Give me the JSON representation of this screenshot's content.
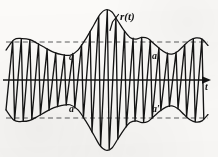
{
  "figure": {
    "kind": "waveform-plot",
    "caption_labels": {
      "signal": "r(t)",
      "envelope_upper_first": "a",
      "envelope_lower_first": "a",
      "envelope_upper_second": "a′",
      "envelope_lower_second": "a′",
      "axis_time": "t"
    },
    "colors": {
      "ink": "#141414",
      "dashed_guide": "#5d5d5d",
      "paper": "#fbfaf8"
    }
  },
  "chart_data": {
    "type": "line",
    "title": "r(t)",
    "xlabel": "t",
    "ylabel": "",
    "grid": false,
    "legend": null,
    "axis": {
      "baseline_y": 0,
      "time_axis_label": "t",
      "arrow_at_right": true,
      "x_range": [
        0,
        218
      ],
      "y_range": [
        -1.35,
        1.35
      ]
    },
    "guides": [
      {
        "name": "upper-dashed-level",
        "label": "a",
        "value": 0.66,
        "style": "dashed"
      },
      {
        "name": "lower-dashed-level",
        "label": "a",
        "value": -0.66,
        "style": "dashed"
      }
    ],
    "annotations": [
      {
        "text": "r(t)",
        "x": 128,
        "y": 16,
        "leader_to": [
          112,
          31
        ]
      },
      {
        "text": "a",
        "x": 72,
        "y": 57
      },
      {
        "text": "a",
        "x": 72,
        "y": 109
      },
      {
        "text": "a′",
        "x": 155,
        "y": 56
      },
      {
        "text": "a′",
        "x": 155,
        "y": 109
      },
      {
        "text": "t",
        "x": 207,
        "y": 87
      }
    ],
    "envelope": {
      "description": "Slowly varying amplitude envelope A(t); carrier oscillation fills between +A(t) and -A(t).",
      "x": [
        6,
        14,
        22,
        30,
        38,
        46,
        54,
        62,
        70,
        78,
        86,
        94,
        100,
        106,
        112,
        118,
        124,
        130,
        136,
        142,
        148,
        154,
        160,
        166,
        172,
        178,
        184,
        190,
        196,
        202,
        208
      ],
      "amplitude": [
        0.52,
        0.7,
        0.72,
        0.7,
        0.63,
        0.55,
        0.48,
        0.44,
        0.43,
        0.52,
        0.72,
        0.96,
        1.14,
        1.22,
        1.18,
        1.02,
        0.86,
        0.74,
        0.71,
        0.74,
        0.72,
        0.63,
        0.54,
        0.47,
        0.45,
        0.5,
        0.6,
        0.69,
        0.73,
        0.71,
        0.6
      ]
    },
    "carrier": {
      "description": "High-frequency sawtooth-like carrier; each cycle rises slowly then falls steeply.",
      "cycles_visible": 23,
      "period_px": 8.6,
      "waveform": "sawtooth"
    },
    "series": [
      {
        "name": "r(t)",
        "role": "modulated-signal",
        "color": "#141414"
      },
      {
        "name": "upper envelope",
        "role": "envelope",
        "color": "#141414"
      },
      {
        "name": "lower envelope",
        "role": "envelope",
        "color": "#141414"
      }
    ]
  }
}
